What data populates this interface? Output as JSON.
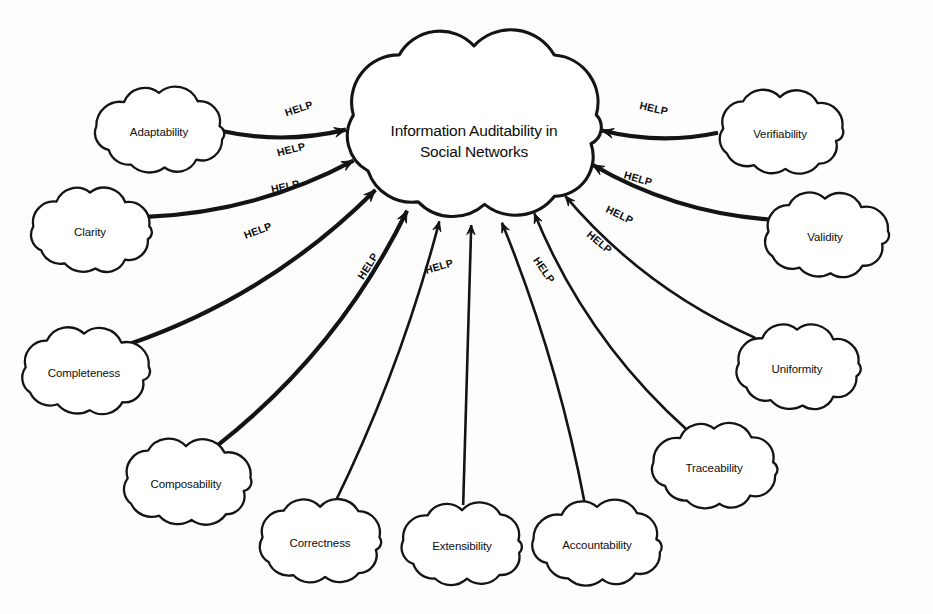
{
  "diagram": {
    "type": "softgoal-interdependency-graph",
    "contribution_label": "HELP",
    "background_color": "#ffffff",
    "stroke_color": "#141414",
    "central_node": {
      "id": "central",
      "label_line1": "Information Auditability in",
      "label_line2": "Social Networks",
      "shape": "cloud",
      "cx": 474,
      "cy": 128,
      "rx": 131,
      "ry": 100
    },
    "contributors": [
      {
        "id": "adaptability",
        "label": "Adaptability",
        "side": "left",
        "cx": 159,
        "cy": 132,
        "rx": 66,
        "ry": 44,
        "help_label": "HELP",
        "help_x": 300,
        "help_y": 112,
        "help_rotate": -18
      },
      {
        "id": "clarity",
        "label": "Clarity",
        "side": "left",
        "cx": 90,
        "cy": 232,
        "rx": 62,
        "ry": 44,
        "help_label": "HELP",
        "help_x": 292,
        "help_y": 153,
        "help_rotate": -14
      },
      {
        "id": "completeness",
        "label": "Completeness",
        "side": "left",
        "cx": 84,
        "cy": 373,
        "rx": 66,
        "ry": 45,
        "help_label": "HELP",
        "help_x": 286,
        "help_y": 190,
        "help_rotate": -12
      },
      {
        "id": "composability",
        "label": "Composability",
        "side": "left",
        "cx": 186,
        "cy": 484,
        "rx": 66,
        "ry": 45,
        "help_label": "HELP",
        "help_x": 259,
        "help_y": 234,
        "help_rotate": -20
      },
      {
        "id": "correctness",
        "label": "Correctness",
        "side": "bottom",
        "cx": 320,
        "cy": 543,
        "rx": 63,
        "ry": 44,
        "help_label": "HELP",
        "help_x": 371,
        "help_y": 268,
        "help_rotate": -58
      },
      {
        "id": "extensibility",
        "label": "Extensibility",
        "side": "bottom",
        "cx": 462,
        "cy": 546,
        "rx": 62,
        "ry": 43,
        "help_label": "HELP",
        "help_x": 440,
        "help_y": 270,
        "help_rotate": -16
      },
      {
        "id": "accountability",
        "label": "Accountability",
        "side": "bottom",
        "cx": 597,
        "cy": 545,
        "rx": 66,
        "ry": 44,
        "help_label": "HELP",
        "help_x": 541,
        "help_y": 272,
        "help_rotate": 55
      },
      {
        "id": "traceability",
        "label": "Traceability",
        "side": "right",
        "cx": 714,
        "cy": 468,
        "rx": 64,
        "ry": 44,
        "help_label": "HELP",
        "help_x": 597,
        "help_y": 245,
        "help_rotate": 40
      },
      {
        "id": "uniformity",
        "label": "Uniformity",
        "side": "right",
        "cx": 797,
        "cy": 369,
        "rx": 64,
        "ry": 44,
        "help_label": "HELP",
        "help_x": 618,
        "help_y": 218,
        "help_rotate": 26
      },
      {
        "id": "validity",
        "label": "Validity",
        "side": "right",
        "cx": 825,
        "cy": 237,
        "rx": 64,
        "ry": 44,
        "help_label": "HELP",
        "help_x": 637,
        "help_y": 182,
        "help_rotate": 16
      },
      {
        "id": "verifiability",
        "label": "Verifiability",
        "side": "right",
        "cx": 780,
        "cy": 134,
        "rx": 64,
        "ry": 44,
        "help_label": "HELP",
        "help_x": 653,
        "help_y": 112,
        "help_rotate": 13
      }
    ]
  },
  "caption": {
    "text": ""
  }
}
